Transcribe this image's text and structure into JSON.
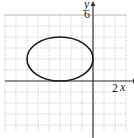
{
  "chart_data": {
    "type": "line",
    "title": "",
    "xlabel": "x",
    "ylabel": "y",
    "tick_labels": {
      "x": [
        "2"
      ],
      "y": [
        "6"
      ]
    },
    "xlim": [
      -8,
      3
    ],
    "ylim": [
      -4,
      6
    ],
    "grid": true,
    "grid_spacing": 1,
    "series": [
      {
        "name": "ellipse",
        "shape": "ellipse",
        "center": [
          -3,
          2
        ],
        "semi_axis_x": 3,
        "semi_axis_y": 2,
        "equation": "(x+3)^2/9 + (y-2)^2/4 = 1",
        "key_points": [
          [
            -6,
            2
          ],
          [
            0,
            2
          ],
          [
            -3,
            4
          ],
          [
            -3,
            0
          ]
        ]
      }
    ],
    "colors": {
      "axes": "#333333",
      "grid": "#999999",
      "curve": "#1a1a1a"
    }
  },
  "axis": {
    "x_label": "x",
    "y_label": "y",
    "x_tick": "2",
    "y_tick": "6"
  }
}
